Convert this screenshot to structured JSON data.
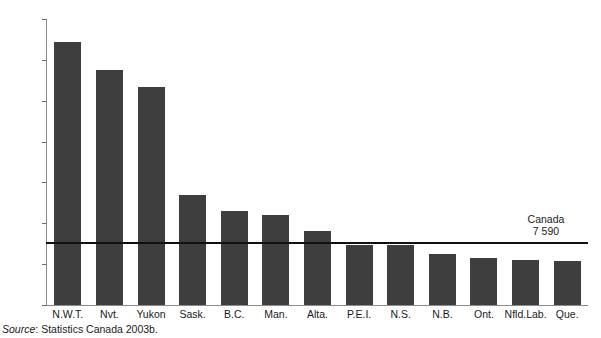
{
  "figure": {
    "source_prefix": "Source",
    "source_separator": ": ",
    "source_text": "Statistics Canada 2003b."
  },
  "chart_data": {
    "type": "bar",
    "title": "",
    "subtitle": "",
    "xlabel": "",
    "ylabel": "",
    "ylim": [
      0,
      35000
    ],
    "yticks": [
      0,
      5000,
      10000,
      15000,
      20000,
      25000,
      30000,
      35000
    ],
    "ytick_labels": [
      "0",
      "5 000",
      "10 000",
      "15 000",
      "20 000",
      "25 000",
      "30 000",
      "35 000"
    ],
    "grid": false,
    "legend": "none",
    "bar_color": "#3e3e3e",
    "categories": [
      "N.W.T.",
      "Nvt.",
      "Yukon",
      "Sask.",
      "B.C.",
      "Man.",
      "Alta.",
      "P.E.I.",
      "N.S.",
      "N.B.",
      "Ont.",
      "Nfld.Lab.",
      "Que."
    ],
    "values": [
      32200,
      28800,
      26700,
      13450,
      11450,
      11050,
      9050,
      7400,
      7400,
      6300,
      5750,
      5450,
      5350
    ],
    "annotations": [
      {
        "type": "reference-line",
        "name": "Canada",
        "label_line1": "Canada",
        "label_line2": "7 590",
        "value": 7590,
        "color": "#111111"
      }
    ]
  }
}
